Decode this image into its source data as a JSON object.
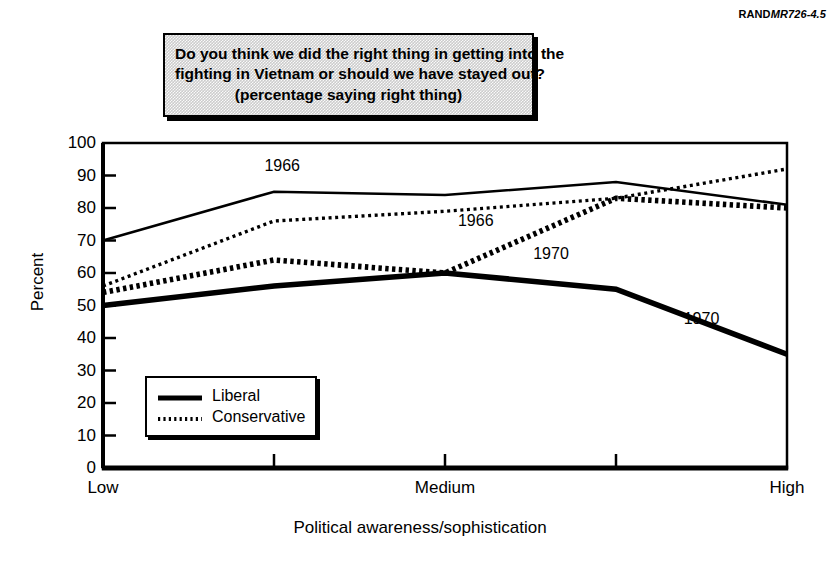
{
  "report_code": {
    "brand": "RAND",
    "number": "MR726-4.5"
  },
  "title": {
    "line1": "Do you think we did the right thing in getting into the",
    "line2": "fighting in Vietnam or should we have stayed out?",
    "line3": "(percentage saying right thing)"
  },
  "axes": {
    "ylabel": "Percent",
    "xlabel": "Political awareness/sophistication",
    "yticks": [
      "100",
      "90",
      "80",
      "70",
      "60",
      "50",
      "40",
      "30",
      "20",
      "10",
      "0"
    ],
    "xticks": [
      "Low",
      "",
      "Medium",
      "",
      "High"
    ]
  },
  "legend": {
    "position": "inside-lower-left",
    "items": [
      {
        "label": "Liberal",
        "style": "thick-solid"
      },
      {
        "label": "Conservative",
        "style": "dotted"
      }
    ]
  },
  "annotations": [
    {
      "text": "1966",
      "series": "Liberal 1966",
      "x_frac": 0.262,
      "y_value": 93
    },
    {
      "text": "1966",
      "series": "Conservative 1966",
      "x_frac": 0.545,
      "y_value": 76
    },
    {
      "text": "1970",
      "series": "Conservative 1970",
      "x_frac": 0.655,
      "y_value": 66
    },
    {
      "text": "1970",
      "series": "Liberal 1970",
      "x_frac": 0.875,
      "y_value": 46
    }
  ],
  "colors": {
    "ink": "#000000",
    "page": "#ffffff",
    "title_box_fill": "#cccccc"
  },
  "chart_data": {
    "type": "line",
    "title": "Do you think we did the right thing in getting into the fighting in Vietnam or should we have stayed out? (percentage saying right thing)",
    "xlabel": "Political awareness/sophistication",
    "ylabel": "Percent",
    "ylim": [
      0,
      100
    ],
    "ytick_step": 10,
    "grid": false,
    "legend_entries": [
      "Liberal",
      "Conservative"
    ],
    "categories": [
      "Low",
      "",
      "Medium",
      "",
      "High"
    ],
    "x_positions": [
      0,
      1,
      2,
      3,
      4
    ],
    "series": [
      {
        "name": "Liberal 1966",
        "ideology": "Liberal",
        "year": 1966,
        "style": "thin-solid",
        "values": [
          70,
          85,
          84,
          88,
          81
        ]
      },
      {
        "name": "Conservative 1966",
        "ideology": "Conservative",
        "year": 1966,
        "style": "thin-dotted",
        "values": [
          56,
          76,
          79,
          83,
          92
        ]
      },
      {
        "name": "Conservative 1970",
        "ideology": "Conservative",
        "year": 1970,
        "style": "thick-dotted",
        "values": [
          54,
          64,
          60,
          83,
          80
        ]
      },
      {
        "name": "Liberal 1970",
        "ideology": "Liberal",
        "year": 1970,
        "style": "thick-solid",
        "values": [
          50,
          56,
          60,
          55,
          35
        ]
      }
    ]
  }
}
